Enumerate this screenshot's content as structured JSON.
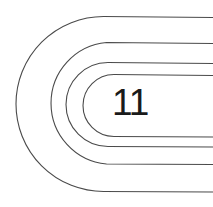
{
  "graphic": {
    "label": "11",
    "stroke_color": "#4a4a4a",
    "text_color": "#1a1a1a",
    "background": "#ffffff",
    "tracks": [
      {
        "name": "outer",
        "top_y": 17,
        "bottom_y": 192,
        "left_x": 16
      },
      {
        "name": "second",
        "top_y": 43,
        "bottom_y": 164,
        "left_x": 46
      },
      {
        "name": "third",
        "top_y": 63,
        "bottom_y": 147,
        "left_x": 66
      },
      {
        "name": "inner",
        "top_y": 75,
        "bottom_y": 137,
        "left_x": 83
      }
    ]
  }
}
